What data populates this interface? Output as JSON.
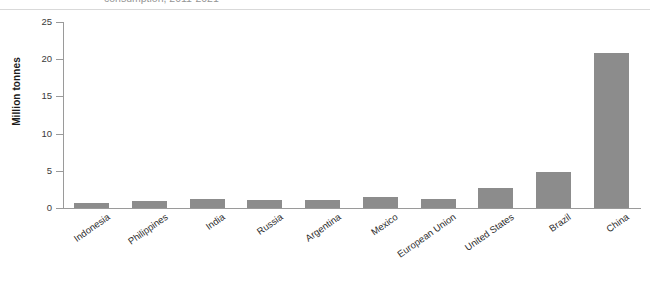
{
  "title": {
    "text": "consumption, 2011-2021",
    "bold_part": "2021",
    "cropped": true
  },
  "chart_data": {
    "type": "bar",
    "title": "consumption, 2011-2021",
    "xlabel": "",
    "ylabel": "Million tonnes",
    "ylim": [
      0,
      25
    ],
    "yticks": [
      0,
      5,
      10,
      15,
      20,
      25
    ],
    "grid": false,
    "legend": "none",
    "bar_color": "#8c8c8c",
    "categories": [
      "Indonesia",
      "Philippines",
      "India",
      "Russia",
      "Argentina",
      "Mexico",
      "European Union",
      "United States",
      "Brazil",
      "China"
    ],
    "values": [
      0.7,
      0.9,
      1.2,
      1.05,
      1.05,
      1.5,
      1.25,
      2.75,
      4.85,
      20.8
    ],
    "units": "Million tonnes"
  },
  "axis": {
    "y_title": "Million tonnes",
    "y_tick_labels": [
      "25",
      "20",
      "15",
      "10",
      "5",
      "0"
    ]
  }
}
